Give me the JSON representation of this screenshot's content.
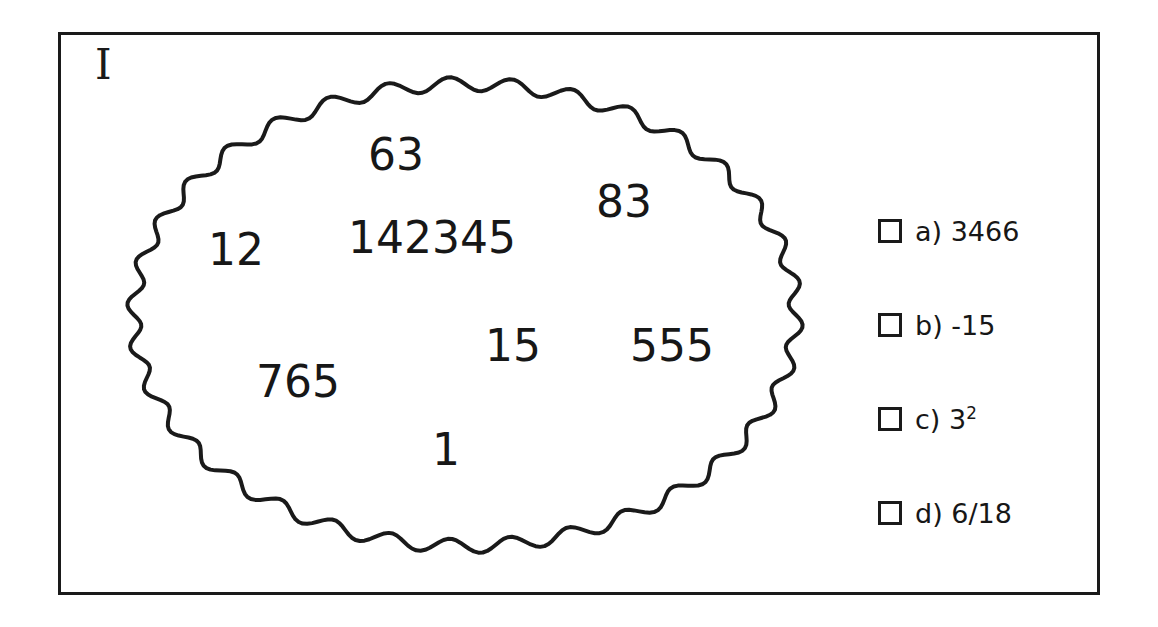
{
  "figure": {
    "type": "venn-set-diagram",
    "universe_label": "I",
    "set_shape": "wavy-oval",
    "background_color": "#ffffff",
    "line_color": "#1a1a1a",
    "text_color": "#171717"
  },
  "set_members": [
    {
      "value": "63",
      "x": 368,
      "y": 133,
      "size": 44
    },
    {
      "value": "83",
      "x": 596,
      "y": 180,
      "size": 44
    },
    {
      "value": "12",
      "x": 208,
      "y": 228,
      "size": 44
    },
    {
      "value": "142345",
      "x": 348,
      "y": 216,
      "size": 44
    },
    {
      "value": "15",
      "x": 485,
      "y": 324,
      "size": 44
    },
    {
      "value": "555",
      "x": 630,
      "y": 324,
      "size": 44
    },
    {
      "value": "765",
      "x": 256,
      "y": 360,
      "size": 44
    },
    {
      "value": "1",
      "x": 432,
      "y": 428,
      "size": 44
    }
  ],
  "answer_options": [
    {
      "letter": "a)",
      "value": "3466",
      "superscript": "",
      "checked": false
    },
    {
      "letter": "b)",
      "value": "-15",
      "superscript": "",
      "checked": false
    },
    {
      "letter": "c)",
      "value": "3",
      "superscript": "2",
      "checked": false
    },
    {
      "letter": "d)",
      "value": "6/18",
      "superscript": "",
      "checked": false
    }
  ]
}
